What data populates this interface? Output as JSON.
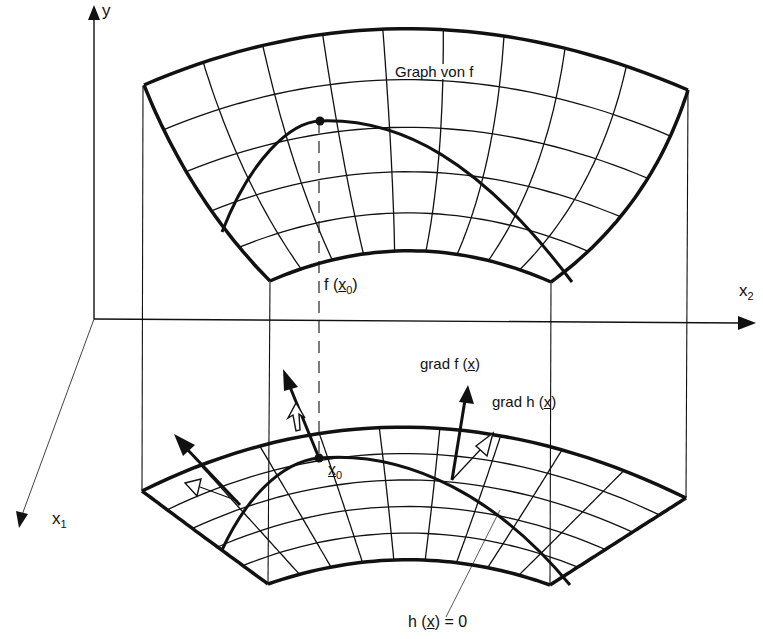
{
  "diagram": {
    "colors": {
      "ink": "#111111",
      "background": "#ffffff"
    },
    "axes": {
      "y": {
        "name": "y"
      },
      "x1": {
        "name": "x",
        "subscript": "1"
      },
      "x2": {
        "name": "x",
        "subscript": "2"
      }
    },
    "labels": {
      "graph_title": "Graph von f",
      "f_x0": {
        "prefix": "f (",
        "var": "x",
        "subscript": "0",
        "suffix": ")"
      },
      "x0": {
        "var": "x",
        "subscript": "0"
      },
      "grad_f": {
        "prefix": "grad f (",
        "var": "x",
        "suffix": ")"
      },
      "grad_h": {
        "prefix": "grad h (",
        "var": "x",
        "suffix": ")"
      },
      "constraint": {
        "prefix": "h (",
        "var": "x",
        "suffix": ") = 0"
      }
    },
    "elements": [
      "upper-surface: graph of f with curvilinear grid",
      "lower-surface: domain with curvilinear grid",
      "constraint-curve on both surfaces",
      "point x0 and its image f(x0)",
      "gradient vectors grad f (filled arrows) and grad h (hollow arrows)"
    ]
  }
}
